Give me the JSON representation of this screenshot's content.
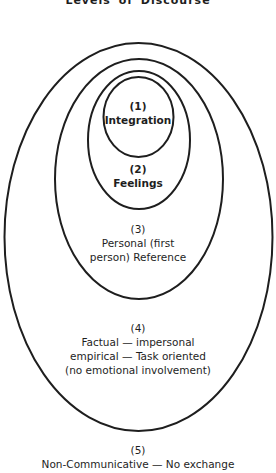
{
  "title": "Levels of Discourse",
  "levels": [
    {
      "number": "(1)",
      "lines": [
        "Integration"
      ]
    },
    {
      "number": "(2)",
      "lines": [
        "Feelings"
      ]
    },
    {
      "number": "(3)",
      "lines": [
        "Personal (first",
        "person) Reference"
      ]
    },
    {
      "number": "(4)",
      "lines": [
        "Factual — impersonal",
        "empirical — Task oriented",
        "(no emotional involvement)"
      ]
    },
    {
      "number": "(5)",
      "lines": [
        "Non-Communicative — No exchange"
      ]
    }
  ],
  "colors": {
    "stroke": "#1e1e1e",
    "background": "#ffffff"
  }
}
